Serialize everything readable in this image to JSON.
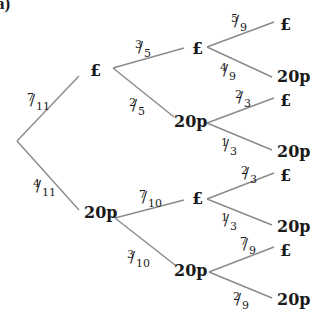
{
  "part_label": "a)",
  "tree": {
    "first": [
      {
        "label": "£",
        "prob": "7/11",
        "prob_num": "7",
        "prob_den": "11",
        "second": [
          {
            "label": "£",
            "prob": "3/5",
            "prob_num": "3",
            "prob_den": "5",
            "third": [
              {
                "label": "£",
                "prob": "5/9",
                "prob_num": "5",
                "prob_den": "9"
              },
              {
                "label": "20p",
                "prob": "4/9",
                "prob_num": "4",
                "prob_den": "9"
              }
            ]
          },
          {
            "label": "20p",
            "prob": "2/5",
            "prob_num": "2",
            "prob_den": "5",
            "third": [
              {
                "label": "£",
                "prob": "2/3",
                "prob_num": "2",
                "prob_den": "3"
              },
              {
                "label": "20p",
                "prob": "1/3",
                "prob_num": "1",
                "prob_den": "3"
              }
            ]
          }
        ]
      },
      {
        "label": "20p",
        "prob": "4/11",
        "prob_num": "4",
        "prob_den": "11",
        "second": [
          {
            "label": "£",
            "prob": "7/10",
            "prob_num": "7",
            "prob_den": "10",
            "third": [
              {
                "label": "£",
                "prob": "2/3",
                "prob_num": "2",
                "prob_den": "3"
              },
              {
                "label": "20p",
                "prob": "1/3",
                "prob_num": "1",
                "prob_den": "3"
              }
            ]
          },
          {
            "label": "20p",
            "prob": "3/10",
            "prob_num": "3",
            "prob_den": "10",
            "third": [
              {
                "label": "£",
                "prob": "7/9",
                "prob_num": "7",
                "prob_den": "9"
              },
              {
                "label": "20p",
                "prob": "2/9",
                "prob_num": "2",
                "prob_den": "9"
              }
            ]
          }
        ]
      }
    ]
  },
  "colors": {
    "line": "#8a8a8a",
    "text": "#1a1a1a"
  }
}
